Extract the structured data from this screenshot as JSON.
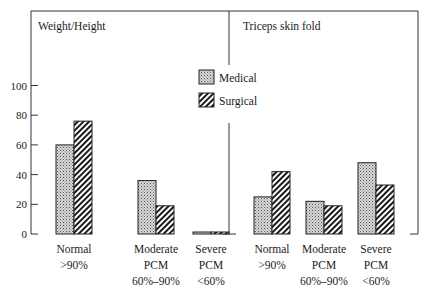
{
  "chart_data": [
    {
      "type": "bar",
      "title": "Weight/Height",
      "categories": [
        "Normal >90%",
        "Moderate PCM 60%–90%",
        "Severe PCM <60%"
      ],
      "category_lines": [
        [
          "Normal",
          ">90%"
        ],
        [
          "Moderate",
          "PCM",
          "60%–90%"
        ],
        [
          "Severe",
          "PCM",
          "<60%"
        ]
      ],
      "series": [
        {
          "name": "Medical",
          "pattern": "stipple",
          "values": [
            60,
            36,
            1
          ]
        },
        {
          "name": "Surgical",
          "pattern": "hatch",
          "values": [
            76,
            19,
            1
          ]
        }
      ],
      "xlabel": "",
      "ylabel": "",
      "yticks": [
        0,
        20,
        40,
        60,
        80,
        100
      ],
      "ylim": [
        0,
        100
      ],
      "grid": false,
      "legend_position": "center-top"
    },
    {
      "type": "bar",
      "title": "Triceps skin fold",
      "categories": [
        "Normal >90%",
        "Moderate PCM 60%–90%",
        "Severe PCM <60%"
      ],
      "category_lines": [
        [
          "Normal",
          ">90%"
        ],
        [
          "Moderate",
          "PCM",
          "60%–90%"
        ],
        [
          "Severe",
          "PCM",
          "<60%"
        ]
      ],
      "series": [
        {
          "name": "Medical",
          "pattern": "stipple",
          "values": [
            25,
            22,
            48
          ]
        },
        {
          "name": "Surgical",
          "pattern": "hatch",
          "values": [
            42,
            19,
            33
          ]
        }
      ],
      "xlabel": "",
      "ylabel": "",
      "yticks": [
        0,
        20,
        40,
        60,
        80,
        100
      ],
      "ylim": [
        0,
        100
      ],
      "grid": false,
      "legend_position": "center-top"
    }
  ],
  "legend": [
    {
      "label": "Medical",
      "pattern": "stipple"
    },
    {
      "label": "Surgical",
      "pattern": "hatch"
    }
  ],
  "colors": {
    "ink": "#1a1a1a",
    "stipple_bg": "#d8d8d8",
    "background": "#ffffff"
  }
}
